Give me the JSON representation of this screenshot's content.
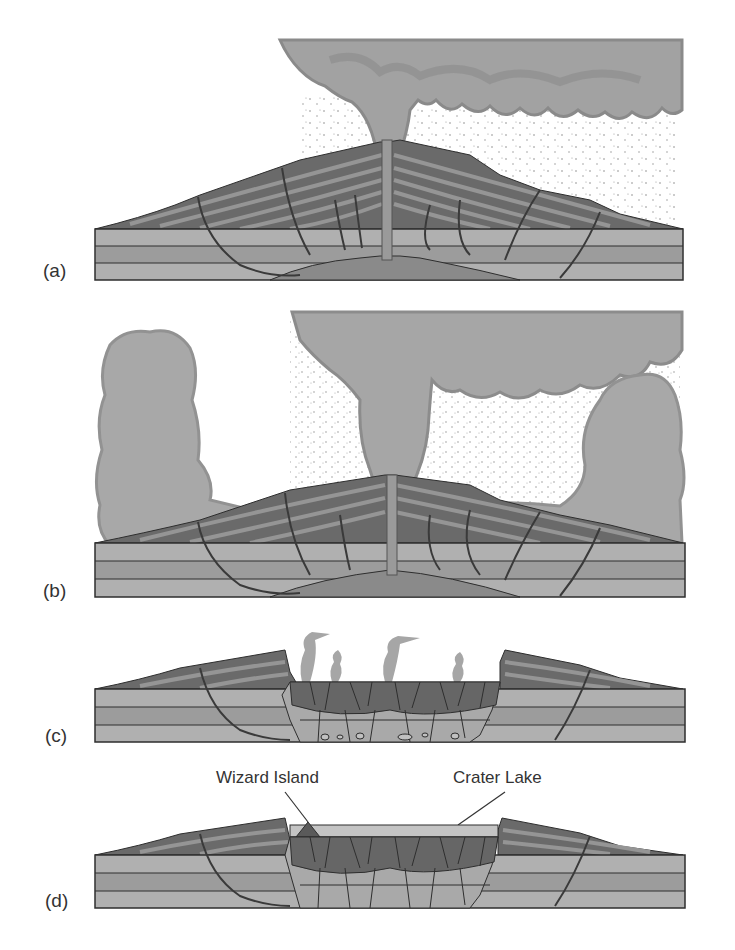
{
  "figure": {
    "colors": {
      "background": "#ffffff",
      "cloud_light": "#a9a9a9",
      "cloud_dark": "#8c8c8c",
      "rock_light": "#b3b3b3",
      "rock_mid": "#9c9c9c",
      "magma": "#8a8a8a",
      "strata_dark": "#5e5e5e",
      "strata_light": "#8f8f8f",
      "outline": "#2e2e2e",
      "lake": "#c4c4c4"
    },
    "panels": [
      {
        "id": "a",
        "label": "(a)",
        "stage": "eruption column from central vent"
      },
      {
        "id": "b",
        "label": "(b)",
        "stage": "eruption with pyroclastic flows"
      },
      {
        "id": "c",
        "label": "(c)",
        "stage": "summit collapse forming caldera"
      },
      {
        "id": "d",
        "label": "(d)",
        "stage": "caldera filled with lake"
      }
    ],
    "callouts": {
      "wizard_island": "Wizard Island",
      "crater_lake": "Crater Lake"
    }
  }
}
